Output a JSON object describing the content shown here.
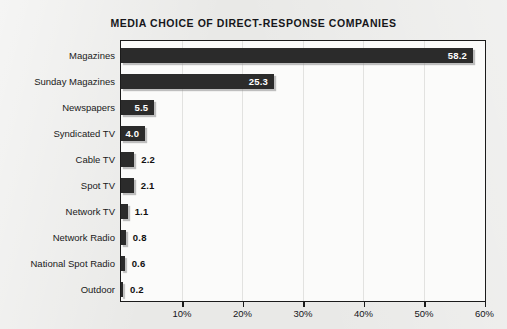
{
  "chart_data": {
    "type": "bar",
    "orientation": "horizontal",
    "title": "MEDIA CHOICE OF DIRECT-RESPONSE COMPANIES",
    "xlabel": "",
    "ylabel": "",
    "xlim": [
      0,
      60
    ],
    "grid": true,
    "legend": null,
    "categories": [
      "Magazines",
      "Sunday Magazines",
      "Newspapers",
      "Syndicated TV",
      "Cable TV",
      "Spot TV",
      "Network TV",
      "Network Radio",
      "National Spot Radio",
      "Outdoor"
    ],
    "values": [
      58.2,
      25.3,
      5.5,
      4.0,
      2.2,
      2.1,
      1.1,
      0.8,
      0.6,
      0.2
    ],
    "value_labels": [
      "58.2",
      "25.3",
      "5.5",
      "4.0",
      "2.2",
      "2.1",
      "1.1",
      "0.8",
      "0.6",
      "0.2"
    ],
    "label_placement": [
      "inside",
      "inside",
      "inside",
      "inside",
      "outside",
      "outside",
      "outside",
      "outside",
      "outside",
      "outside"
    ],
    "xticks": [
      0,
      10,
      20,
      30,
      40,
      50,
      60
    ],
    "xtick_labels": [
      "",
      "10%",
      "20%",
      "30%",
      "40%",
      "50%",
      "60%"
    ],
    "colors": {
      "bar": "#2b2b2b",
      "plot_background": "#fbfbfa",
      "page_background": "#e9e9e7",
      "gridline": "#e2e2e0",
      "frame": "#1b1b1b",
      "value_label_inside": "#ffffff",
      "value_label_outside": "#101010",
      "title": "#16161a"
    }
  }
}
